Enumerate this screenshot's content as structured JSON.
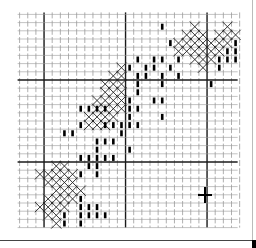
{
  "pattern": {
    "grid": {
      "origin_x": 19.6,
      "origin_y": 14.4,
      "cell_w": 8.15,
      "cell_h": 8.2,
      "cols": 27,
      "rows": 26,
      "major_every": 10,
      "major_cols": [
        3,
        13,
        23
      ],
      "major_rows": [
        8,
        18
      ],
      "minor_color": "#9a9a9a",
      "major_color": "#1a1a1a"
    },
    "crosses": [
      [
        1,
        21
      ],
      [
        1,
        25
      ],
      [
        2,
        20
      ],
      [
        2,
        21
      ],
      [
        2,
        22
      ],
      [
        2,
        24
      ],
      [
        2,
        25
      ],
      [
        2,
        26
      ],
      [
        3,
        19
      ],
      [
        3,
        20
      ],
      [
        3,
        21
      ],
      [
        3,
        22
      ],
      [
        3,
        23
      ],
      [
        3,
        24
      ],
      [
        3,
        25
      ],
      [
        4,
        19
      ],
      [
        4,
        20
      ],
      [
        4,
        21
      ],
      [
        4,
        22
      ],
      [
        4,
        23
      ],
      [
        4,
        24
      ],
      [
        5,
        21
      ],
      [
        5,
        22
      ],
      [
        5,
        23
      ],
      [
        6,
        22
      ],
      [
        6,
        12
      ],
      [
        7,
        11
      ],
      [
        7,
        12
      ],
      [
        8,
        10
      ],
      [
        8,
        11
      ],
      [
        8,
        12
      ],
      [
        9,
        10
      ],
      [
        9,
        11
      ],
      [
        9,
        12
      ],
      [
        10,
        9
      ],
      [
        10,
        10
      ],
      [
        10,
        11
      ],
      [
        10,
        12
      ],
      [
        11,
        9
      ],
      [
        11,
        10
      ],
      [
        11,
        11
      ],
      [
        11,
        12
      ],
      [
        12,
        8
      ],
      [
        12,
        9
      ],
      [
        12,
        10
      ],
      [
        12,
        11
      ],
      [
        13,
        8
      ],
      [
        13,
        9
      ],
      [
        13,
        10
      ],
      [
        18,
        4
      ],
      [
        18,
        5
      ],
      [
        19,
        2
      ],
      [
        19,
        3
      ],
      [
        19,
        4
      ],
      [
        19,
        5
      ],
      [
        19,
        6
      ],
      [
        20,
        3
      ],
      [
        20,
        4
      ],
      [
        20,
        5
      ],
      [
        20,
        6
      ],
      [
        21,
        4
      ],
      [
        21,
        5
      ],
      [
        21,
        6
      ],
      [
        21,
        7
      ],
      [
        22,
        3
      ],
      [
        22,
        4
      ],
      [
        22,
        5
      ],
      [
        22,
        6
      ],
      [
        23,
        2
      ],
      [
        23,
        3
      ],
      [
        23,
        4
      ],
      [
        23,
        5
      ],
      [
        24,
        3
      ],
      [
        24,
        4
      ],
      [
        25,
        4
      ]
    ],
    "bars": [
      [
        1,
        17
      ],
      [
        3,
        18
      ],
      [
        3,
        26
      ],
      [
        4,
        25
      ],
      [
        4,
        26
      ],
      [
        5,
        14
      ],
      [
        5,
        16
      ],
      [
        5,
        17
      ],
      [
        5,
        19
      ],
      [
        5,
        24
      ],
      [
        5,
        25
      ],
      [
        5,
        26
      ],
      [
        6,
        13
      ],
      [
        6,
        15
      ],
      [
        6,
        16
      ],
      [
        6,
        18
      ],
      [
        6,
        24
      ],
      [
        7,
        14
      ],
      [
        7,
        15
      ],
      [
        7,
        17
      ],
      [
        7,
        19
      ],
      [
        8,
        14
      ],
      [
        8,
        17
      ],
      [
        8,
        23
      ],
      [
        9,
        14
      ],
      [
        10,
        13
      ],
      [
        10,
        16
      ],
      [
        10,
        17
      ],
      [
        11,
        7
      ],
      [
        11,
        8
      ],
      [
        11,
        9
      ],
      [
        11,
        10
      ],
      [
        11,
        13
      ],
      [
        11,
        14
      ],
      [
        12,
        13
      ],
      [
        12,
        17
      ],
      [
        13,
        7
      ],
      [
        13,
        10
      ],
      [
        13,
        11
      ],
      [
        13,
        12
      ],
      [
        13,
        13
      ],
      [
        13,
        14
      ],
      [
        14,
        5
      ],
      [
        14,
        6
      ],
      [
        14,
        12
      ],
      [
        15,
        9
      ],
      [
        15,
        10
      ],
      [
        15,
        11
      ],
      [
        16,
        9
      ],
      [
        16,
        13
      ],
      [
        17,
        7
      ],
      [
        17,
        8
      ],
      [
        17,
        9
      ],
      [
        17,
        10
      ],
      [
        17,
        11
      ],
      [
        18,
        8
      ],
      [
        18,
        9
      ],
      [
        19,
        7
      ],
      [
        19,
        9
      ],
      [
        22,
        7
      ],
      [
        23,
        7
      ],
      [
        23,
        8
      ],
      [
        23,
        9
      ],
      [
        24,
        5
      ],
      [
        24,
        7
      ],
      [
        24,
        8
      ],
      [
        24,
        9
      ],
      [
        24,
        10
      ],
      [
        25,
        5
      ],
      [
        25,
        7
      ]
    ],
    "center_marker": {
      "x": 205,
      "y": 195,
      "symbol": "plus"
    },
    "stitch_color": "#222222",
    "bar_color": "#000000"
  }
}
